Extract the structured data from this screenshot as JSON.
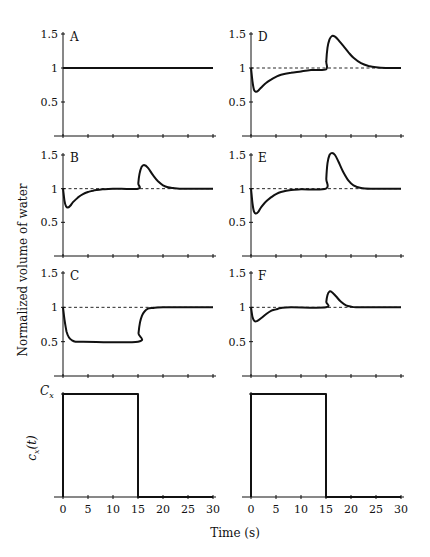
{
  "figure": {
    "ylabel": "Normalized volume of water",
    "xlabel": "Time (s)",
    "bottom_ylabel": "c_x(t)",
    "bottom_ytick": "C_x"
  },
  "chart_data": [
    {
      "panel": "A",
      "type": "line",
      "xlim": [
        0,
        30
      ],
      "ylim": [
        0,
        1.5
      ],
      "xticks": [
        0,
        5,
        10,
        15,
        20,
        25,
        30
      ],
      "yticks": [
        0.5,
        1,
        1.5
      ],
      "ytick_labels": [
        "0.5",
        "1",
        "1.5"
      ],
      "reference_line": 1,
      "series": [
        {
          "name": "normalized volume",
          "x": [
            0,
            30
          ],
          "y": [
            1,
            1
          ]
        }
      ]
    },
    {
      "panel": "B",
      "type": "line",
      "xlim": [
        0,
        30
      ],
      "ylim": [
        0,
        1.5
      ],
      "xticks": [
        0,
        5,
        10,
        15,
        20,
        25,
        30
      ],
      "yticks": [
        0.5,
        1,
        1.5
      ],
      "ytick_labels": [
        "0.5",
        "1",
        "1.5"
      ],
      "reference_line": 1,
      "series": [
        {
          "name": "normalized volume",
          "x": [
            0,
            0.3,
            0.6,
            1,
            1.5,
            2,
            3,
            4,
            5,
            6,
            8,
            10,
            15,
            15.05,
            15.3,
            15.7,
            16.2,
            17,
            18,
            19,
            20,
            21,
            22,
            24,
            26,
            30
          ],
          "y": [
            1,
            0.82,
            0.74,
            0.72,
            0.75,
            0.8,
            0.87,
            0.92,
            0.95,
            0.97,
            0.99,
            1,
            1,
            1.08,
            1.22,
            1.32,
            1.35,
            1.31,
            1.2,
            1.11,
            1.05,
            1.02,
            1.01,
            1,
            1,
            1
          ]
        }
      ]
    },
    {
      "panel": "C",
      "type": "line",
      "xlim": [
        0,
        30
      ],
      "ylim": [
        0,
        1.5
      ],
      "xticks": [
        0,
        5,
        10,
        15,
        20,
        25,
        30
      ],
      "yticks": [
        0.5,
        1,
        1.5
      ],
      "ytick_labels": [
        "0.5",
        "1",
        "1.5"
      ],
      "reference_line": 1,
      "series": [
        {
          "name": "normalized volume",
          "x": [
            0,
            0.3,
            0.7,
            1.2,
            1.8,
            2.5,
            4,
            15,
            15.1,
            15.4,
            15.8,
            16.3,
            17,
            18,
            20,
            30
          ],
          "y": [
            1,
            0.82,
            0.65,
            0.56,
            0.52,
            0.5,
            0.5,
            0.5,
            0.62,
            0.78,
            0.88,
            0.94,
            0.98,
            0.99,
            1,
            1
          ]
        }
      ]
    },
    {
      "panel": "D",
      "type": "line",
      "xlim": [
        0,
        30
      ],
      "ylim": [
        0,
        1.5
      ],
      "xticks": [
        0,
        5,
        10,
        15,
        20,
        25,
        30
      ],
      "yticks": [
        0.5,
        1,
        1.5
      ],
      "ytick_labels": [
        "0.5",
        "1",
        "1.5"
      ],
      "reference_line": 1,
      "series": [
        {
          "name": "normalized volume",
          "x": [
            0,
            0.3,
            0.6,
            1,
            1.5,
            2,
            3,
            4,
            5,
            6,
            8,
            10,
            12,
            15,
            15.05,
            15.3,
            15.7,
            16.2,
            16.8,
            17.5,
            18.5,
            19.5,
            20.5,
            22,
            23.5,
            25,
            27,
            30
          ],
          "y": [
            1,
            0.8,
            0.68,
            0.65,
            0.67,
            0.71,
            0.78,
            0.83,
            0.87,
            0.9,
            0.93,
            0.95,
            0.97,
            0.98,
            1.1,
            1.3,
            1.42,
            1.47,
            1.46,
            1.41,
            1.32,
            1.23,
            1.15,
            1.07,
            1.03,
            1.01,
            1,
            1
          ]
        }
      ]
    },
    {
      "panel": "E",
      "type": "line",
      "xlim": [
        0,
        30
      ],
      "ylim": [
        0,
        1.5
      ],
      "xticks": [
        0,
        5,
        10,
        15,
        20,
        25,
        30
      ],
      "yticks": [
        0.5,
        1,
        1.5
      ],
      "ytick_labels": [
        "0.5",
        "1",
        "1.5"
      ],
      "reference_line": 1,
      "series": [
        {
          "name": "normalized volume",
          "x": [
            0,
            0.3,
            0.6,
            1,
            1.5,
            2,
            3,
            4,
            5,
            6,
            8,
            10,
            15,
            15.05,
            15.3,
            15.7,
            16.2,
            16.8,
            17.5,
            18.5,
            19.5,
            20.5,
            22,
            24,
            30
          ],
          "y": [
            1,
            0.78,
            0.66,
            0.63,
            0.66,
            0.72,
            0.81,
            0.87,
            0.92,
            0.95,
            0.98,
            0.99,
            1,
            1.15,
            1.38,
            1.5,
            1.53,
            1.5,
            1.4,
            1.24,
            1.12,
            1.05,
            1.01,
            1,
            1
          ]
        }
      ]
    },
    {
      "panel": "F",
      "type": "line",
      "xlim": [
        0,
        30
      ],
      "ylim": [
        0,
        1.5
      ],
      "xticks": [
        0,
        5,
        10,
        15,
        20,
        25,
        30
      ],
      "yticks": [
        0.5,
        1,
        1.5
      ],
      "ytick_labels": [
        "0.5",
        "1",
        "1.5"
      ],
      "reference_line": 1,
      "series": [
        {
          "name": "normalized volume",
          "x": [
            0,
            0.3,
            0.7,
            1.2,
            2,
            3,
            4,
            5,
            6,
            8,
            15,
            15.05,
            15.3,
            15.7,
            16.2,
            17,
            18,
            19,
            20,
            21,
            23,
            30
          ],
          "y": [
            1,
            0.86,
            0.8,
            0.8,
            0.84,
            0.9,
            0.95,
            0.97,
            0.99,
            1,
            1,
            1.08,
            1.18,
            1.23,
            1.22,
            1.16,
            1.08,
            1.03,
            1.01,
            1,
            1,
            1
          ]
        }
      ]
    },
    {
      "panel": "input-left",
      "type": "line",
      "xlim": [
        0,
        30
      ],
      "ylim": [
        0,
        1
      ],
      "xticks": [
        0,
        5,
        10,
        15,
        20,
        25,
        30
      ],
      "xtick_labels": [
        "0",
        "5",
        "10",
        "15",
        "20",
        "25",
        "30"
      ],
      "ytick_labels": [
        "C_x"
      ],
      "ylabel": "c_x(t)",
      "series": [
        {
          "name": "c_x(t)",
          "x": [
            0,
            0,
            15,
            15,
            30
          ],
          "y": [
            0,
            1,
            1,
            0,
            0
          ]
        }
      ]
    },
    {
      "panel": "input-right",
      "type": "line",
      "xlim": [
        0,
        30
      ],
      "ylim": [
        0,
        1
      ],
      "xticks": [
        0,
        5,
        10,
        15,
        20,
        25,
        30
      ],
      "xtick_labels": [
        "0",
        "5",
        "10",
        "15",
        "20",
        "25",
        "30"
      ],
      "series": [
        {
          "name": "c_x(t)",
          "x": [
            0,
            0,
            15,
            15,
            30
          ],
          "y": [
            0,
            1,
            1,
            0,
            0
          ]
        }
      ]
    }
  ]
}
